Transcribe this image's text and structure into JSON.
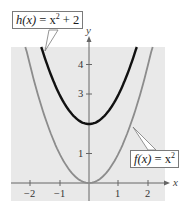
{
  "chart_data": {
    "type": "line",
    "title": "",
    "xlabel": "x",
    "ylabel": "y",
    "xlim": [
      -2.65,
      2.6
    ],
    "ylim": [
      -0.6,
      4.6
    ],
    "x_ticks": [
      -2,
      -1,
      1,
      2
    ],
    "y_ticks": [
      1,
      3,
      4
    ],
    "grid": false,
    "background": "#e9e9e9",
    "series": [
      {
        "name": "h(x) = x^2 + 2",
        "label_parts": {
          "fn": "h(x)",
          "eq": " = x",
          "exp": "2",
          "tail": " + 2"
        },
        "color": "#111111",
        "formula": "x^2 + 2",
        "x": [
          -1.6,
          -1.5,
          -1.0,
          -0.5,
          0,
          0.5,
          1.0,
          1.5,
          1.6
        ],
        "y": [
          4.56,
          4.25,
          3.0,
          2.25,
          2.0,
          2.25,
          3.0,
          4.25,
          4.56
        ]
      },
      {
        "name": "f(x) = x^2",
        "label_parts": {
          "fn": "f(x)",
          "eq": " = x",
          "exp": "2",
          "tail": ""
        },
        "color": "#8c8c8c",
        "formula": "x^2",
        "x": [
          -2.14,
          -2.0,
          -1.5,
          -1.0,
          -0.5,
          0,
          0.5,
          1.0,
          1.5,
          2.0,
          2.14
        ],
        "y": [
          4.58,
          4.0,
          2.25,
          1.0,
          0.25,
          0,
          0.25,
          1.0,
          2.25,
          4.0,
          4.58
        ]
      }
    ]
  },
  "labels": {
    "h": {
      "fn": "h(x)",
      "eq": " = x",
      "exp": "2",
      "tail": " + 2"
    },
    "f": {
      "fn": "f(x)",
      "eq": " = x",
      "exp": "2",
      "tail": ""
    }
  },
  "ticks": {
    "x": [
      "−2",
      "−1",
      "1",
      "2"
    ],
    "y": [
      "1",
      "3",
      "4"
    ]
  },
  "axes": {
    "x": "x",
    "y": "y"
  }
}
